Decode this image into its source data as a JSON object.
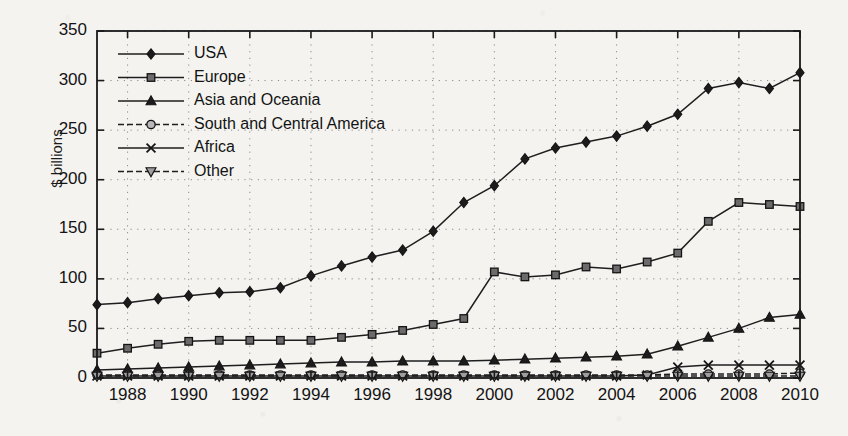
{
  "chart_data": {
    "type": "line",
    "title": "",
    "subtitle": "",
    "xlabel": "",
    "ylabel": "$ billions",
    "xlim": [
      1987,
      2010
    ],
    "ylim": [
      0,
      350
    ],
    "yticks": [
      0,
      50,
      100,
      150,
      200,
      250,
      300,
      350
    ],
    "xticks": [
      1988,
      1990,
      1992,
      1994,
      1996,
      1998,
      2000,
      2002,
      2004,
      2006,
      2008,
      2010
    ],
    "x": [
      1987,
      1988,
      1989,
      1990,
      1991,
      1992,
      1993,
      1994,
      1995,
      1996,
      1997,
      1998,
      1999,
      2000,
      2001,
      2002,
      2003,
      2004,
      2005,
      2006,
      2007,
      2008,
      2009,
      2010
    ],
    "grid": "dotted",
    "legend_position": "upper-left-inside",
    "series": [
      {
        "name": "USA",
        "marker": "diamond",
        "marker_fill": "#1c1c1c",
        "line_style": "solid",
        "values": [
          74,
          76,
          80,
          83,
          86,
          87,
          91,
          103,
          113,
          122,
          129,
          148,
          177,
          194,
          221,
          232,
          238,
          244,
          254,
          266,
          292,
          298,
          292,
          308
        ]
      },
      {
        "name": "Europe",
        "marker": "square",
        "marker_fill": "#6b6b6b",
        "line_style": "solid",
        "values": [
          25,
          30,
          34,
          37,
          38,
          38,
          38,
          38,
          41,
          44,
          48,
          54,
          60,
          107,
          102,
          104,
          112,
          110,
          117,
          126,
          158,
          177,
          175,
          173
        ]
      },
      {
        "name": "Asia and Oceania",
        "marker": "triangle-up",
        "marker_fill": "#1c1c1c",
        "line_style": "solid",
        "values": [
          8,
          9,
          10,
          11,
          12,
          13,
          14,
          15,
          16,
          16,
          17,
          17,
          17,
          18,
          19,
          20,
          21,
          22,
          24,
          32,
          41,
          50,
          61,
          64
        ]
      },
      {
        "name": "South and Central America",
        "marker": "circle-open",
        "marker_fill": "#b9b9b9",
        "line_style": "dashed",
        "values": [
          3,
          3,
          3,
          3,
          3,
          3,
          3,
          3,
          3,
          3,
          3,
          3,
          3,
          3,
          3,
          3,
          3,
          3,
          3,
          4,
          4,
          4,
          4,
          5
        ]
      },
      {
        "name": "Africa",
        "marker": "x",
        "marker_fill": "#1c1c1c",
        "line_style": "solid",
        "values": [
          2,
          2,
          2,
          2,
          2,
          2,
          2,
          2,
          2,
          2,
          2,
          2,
          2,
          2,
          2,
          2,
          2,
          2,
          3,
          11,
          13,
          13,
          13,
          13
        ]
      },
      {
        "name": "Other",
        "marker": "triangle-down",
        "marker_fill": "#9e9e9e",
        "line_style": "dashed",
        "values": [
          2,
          2,
          2,
          2,
          2,
          2,
          2,
          2,
          2,
          2,
          2,
          2,
          2,
          2,
          2,
          2,
          2,
          2,
          2,
          2,
          2,
          2,
          2,
          2
        ]
      }
    ]
  },
  "axes": {
    "y_label": "$ billions",
    "y_tick_labels": [
      "350",
      "300",
      "250",
      "200",
      "150",
      "100",
      "50",
      "0"
    ],
    "x_tick_labels": [
      "1988",
      "1990",
      "1992",
      "1994",
      "1996",
      "1998",
      "2000",
      "2002",
      "2004",
      "2006",
      "2008",
      "2010"
    ]
  },
  "legend": {
    "items": [
      {
        "label": "USA"
      },
      {
        "label": "Europe"
      },
      {
        "label": "Asia and Oceania"
      },
      {
        "label": "South and Central America"
      },
      {
        "label": "Africa"
      },
      {
        "label": "Other"
      }
    ]
  },
  "colors": {
    "axis": "#1a1a1a",
    "grid": "#8a8a8a",
    "background": "#f4f3f0",
    "usa": "#1c1c1c",
    "europe": "#6b6b6b",
    "asia": "#1c1c1c",
    "south_america": "#b9b9b9",
    "africa": "#1c1c1c",
    "other": "#9e9e9e"
  }
}
